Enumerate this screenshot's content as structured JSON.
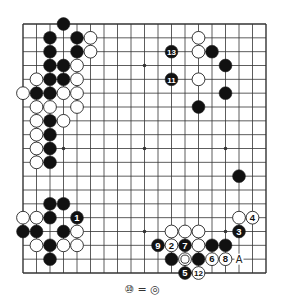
{
  "diagram": {
    "type": "go-board",
    "size": 19,
    "colors": {
      "line": "#333333",
      "black": "#111111",
      "white": "#ffffff",
      "background": "#ffffff"
    },
    "star_points": [
      [
        3,
        3
      ],
      [
        9,
        3
      ],
      [
        15,
        3
      ],
      [
        3,
        9
      ],
      [
        9,
        9
      ],
      [
        15,
        9
      ],
      [
        3,
        15
      ],
      [
        9,
        15
      ],
      [
        15,
        15
      ]
    ],
    "stones": [
      {
        "c": 3,
        "r": 0,
        "color": "black"
      },
      {
        "c": 2,
        "r": 1,
        "color": "black"
      },
      {
        "c": 4,
        "r": 1,
        "color": "black"
      },
      {
        "c": 5,
        "r": 1,
        "color": "white"
      },
      {
        "c": 2,
        "r": 2,
        "color": "black"
      },
      {
        "c": 4,
        "r": 2,
        "color": "black"
      },
      {
        "c": 5,
        "r": 2,
        "color": "white"
      },
      {
        "c": 2,
        "r": 3,
        "color": "black"
      },
      {
        "c": 3,
        "r": 3,
        "color": "black"
      },
      {
        "c": 4,
        "r": 3,
        "color": "white"
      },
      {
        "c": 1,
        "r": 4,
        "color": "white"
      },
      {
        "c": 2,
        "r": 4,
        "color": "black"
      },
      {
        "c": 3,
        "r": 4,
        "color": "black"
      },
      {
        "c": 4,
        "r": 4,
        "color": "white"
      },
      {
        "c": 0,
        "r": 5,
        "color": "white"
      },
      {
        "c": 1,
        "r": 5,
        "color": "black"
      },
      {
        "c": 2,
        "r": 5,
        "color": "black"
      },
      {
        "c": 3,
        "r": 5,
        "color": "white"
      },
      {
        "c": 4,
        "r": 5,
        "color": "white"
      },
      {
        "c": 1,
        "r": 6,
        "color": "white"
      },
      {
        "c": 2,
        "r": 6,
        "color": "white"
      },
      {
        "c": 4,
        "r": 6,
        "color": "white"
      },
      {
        "c": 1,
        "r": 7,
        "color": "white"
      },
      {
        "c": 2,
        "r": 7,
        "color": "black"
      },
      {
        "c": 3,
        "r": 7,
        "color": "white"
      },
      {
        "c": 1,
        "r": 8,
        "color": "white"
      },
      {
        "c": 2,
        "r": 8,
        "color": "black"
      },
      {
        "c": 1,
        "r": 9,
        "color": "white"
      },
      {
        "c": 2,
        "r": 9,
        "color": "black"
      },
      {
        "c": 1,
        "r": 10,
        "color": "white"
      },
      {
        "c": 2,
        "r": 10,
        "color": "black"
      },
      {
        "c": 2,
        "r": 13,
        "color": "black"
      },
      {
        "c": 3,
        "r": 13,
        "color": "black"
      },
      {
        "c": 0,
        "r": 14,
        "color": "white"
      },
      {
        "c": 1,
        "r": 14,
        "color": "white"
      },
      {
        "c": 2,
        "r": 14,
        "color": "black"
      },
      {
        "c": 4,
        "r": 14,
        "color": "black",
        "label": "1"
      },
      {
        "c": 0,
        "r": 15,
        "color": "black"
      },
      {
        "c": 1,
        "r": 15,
        "color": "black"
      },
      {
        "c": 3,
        "r": 15,
        "color": "black"
      },
      {
        "c": 4,
        "r": 15,
        "color": "white"
      },
      {
        "c": 1,
        "r": 16,
        "color": "white"
      },
      {
        "c": 2,
        "r": 16,
        "color": "black"
      },
      {
        "c": 3,
        "r": 16,
        "color": "white"
      },
      {
        "c": 4,
        "r": 16,
        "color": "white"
      },
      {
        "c": 2,
        "r": 17,
        "color": "black"
      },
      {
        "c": 13,
        "r": 1,
        "color": "white"
      },
      {
        "c": 11,
        "r": 2,
        "color": "black",
        "label": "13"
      },
      {
        "c": 13,
        "r": 2,
        "color": "white"
      },
      {
        "c": 14,
        "r": 2,
        "color": "black"
      },
      {
        "c": 15,
        "r": 3,
        "color": "black"
      },
      {
        "c": 11,
        "r": 4,
        "color": "black",
        "label": "11"
      },
      {
        "c": 13,
        "r": 4,
        "color": "white"
      },
      {
        "c": 15,
        "r": 5,
        "color": "black"
      },
      {
        "c": 13,
        "r": 6,
        "color": "black"
      },
      {
        "c": 16,
        "r": 11,
        "color": "black"
      },
      {
        "c": 16,
        "r": 14,
        "color": "white"
      },
      {
        "c": 17,
        "r": 14,
        "color": "white",
        "label": "4"
      },
      {
        "c": 11,
        "r": 15,
        "color": "white"
      },
      {
        "c": 12,
        "r": 15,
        "color": "white"
      },
      {
        "c": 13,
        "r": 15,
        "color": "white"
      },
      {
        "c": 16,
        "r": 15,
        "color": "black",
        "label": "3"
      },
      {
        "c": 10,
        "r": 16,
        "color": "black",
        "label": "9"
      },
      {
        "c": 11,
        "r": 16,
        "color": "white",
        "label": "2"
      },
      {
        "c": 12,
        "r": 16,
        "color": "black",
        "label": "7"
      },
      {
        "c": 13,
        "r": 16,
        "color": "white"
      },
      {
        "c": 14,
        "r": 16,
        "color": "black"
      },
      {
        "c": 15,
        "r": 16,
        "color": "black"
      },
      {
        "c": 11,
        "r": 17,
        "color": "black"
      },
      {
        "c": 12,
        "r": 17,
        "color": "white",
        "marked": true
      },
      {
        "c": 13,
        "r": 17,
        "color": "black"
      },
      {
        "c": 14,
        "r": 17,
        "color": "white",
        "label": "6"
      },
      {
        "c": 15,
        "r": 17,
        "color": "white",
        "label": "8"
      },
      {
        "c": 12,
        "r": 18,
        "color": "black",
        "label": "5"
      },
      {
        "c": 13,
        "r": 18,
        "color": "white",
        "label": "12"
      }
    ],
    "point_labels": [
      {
        "c": 16,
        "r": 17,
        "text": "A"
      }
    ],
    "caption": "⑩ = ◎"
  }
}
